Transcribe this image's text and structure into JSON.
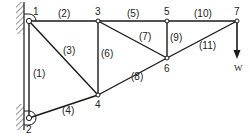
{
  "diagram": {
    "type": "truss",
    "load_label": "W",
    "nodes": [
      {
        "id": "1",
        "label": "1",
        "x": 29,
        "y": 21
      },
      {
        "id": "2",
        "label": "2",
        "x": 29,
        "y": 118
      },
      {
        "id": "3",
        "label": "3",
        "x": 98,
        "y": 21
      },
      {
        "id": "4",
        "label": "4",
        "x": 98,
        "y": 95
      },
      {
        "id": "5",
        "label": "5",
        "x": 167,
        "y": 21
      },
      {
        "id": "6",
        "label": "6",
        "x": 167,
        "y": 58
      },
      {
        "id": "7",
        "label": "7",
        "x": 237,
        "y": 21
      }
    ],
    "members": [
      {
        "label": "(1)",
        "from": "1",
        "to": "2"
      },
      {
        "label": "(2)",
        "from": "1",
        "to": "3"
      },
      {
        "label": "(3)",
        "from": "1",
        "to": "4"
      },
      {
        "label": "(4)",
        "from": "2",
        "to": "4"
      },
      {
        "label": "(5)",
        "from": "3",
        "to": "5"
      },
      {
        "label": "(6)",
        "from": "3",
        "to": "4"
      },
      {
        "label": "(7)",
        "from": "3",
        "to": "6"
      },
      {
        "label": "(8)",
        "from": "4",
        "to": "6"
      },
      {
        "label": "(9)",
        "from": "5",
        "to": "6"
      },
      {
        "label": "(10)",
        "from": "5",
        "to": "7"
      },
      {
        "label": "(11)",
        "from": "6",
        "to": "7"
      }
    ],
    "supports": [
      {
        "node": "1",
        "type": "pin-wall"
      },
      {
        "node": "2",
        "type": "pin-wall"
      }
    ],
    "colors": {
      "line": "#1a1a1a",
      "text": "#222222",
      "background": "#ffffff"
    }
  }
}
